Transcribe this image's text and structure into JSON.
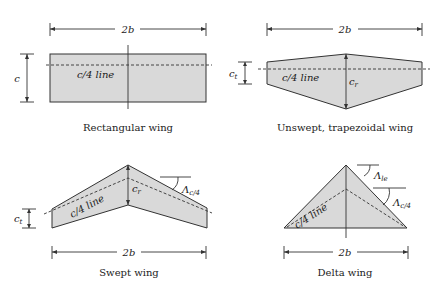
{
  "figure": {
    "panels": [
      {
        "id": "rectangular",
        "caption": "Rectangular wing",
        "span_label": "2b",
        "chord_label": "c",
        "quarter_chord_label": "c/4 line"
      },
      {
        "id": "trapezoidal",
        "caption": "Unswept, trapezoidal wing",
        "span_label": "2b",
        "tip_chord_label": "c",
        "tip_chord_sub": "t",
        "root_chord_label": "c",
        "root_chord_sub": "r",
        "quarter_chord_label": "c/4 line"
      },
      {
        "id": "swept",
        "caption": "Swept wing",
        "span_label": "2b",
        "tip_chord_label": "c",
        "tip_chord_sub": "t",
        "root_chord_label": "c",
        "root_chord_sub": "r",
        "quarter_chord_label": "c/4 line",
        "sweep_label": "Λ",
        "sweep_sub": "c/4"
      },
      {
        "id": "delta",
        "caption": "Delta wing",
        "span_label": "2b",
        "quarter_chord_label": "c/4 line",
        "le_sweep_label": "Λ",
        "le_sweep_sub": "le",
        "sweep_label": "Λ",
        "sweep_sub": "c/4"
      }
    ],
    "colors": {
      "wing_fill": "#d9d9d9",
      "stroke": "#333333"
    }
  }
}
